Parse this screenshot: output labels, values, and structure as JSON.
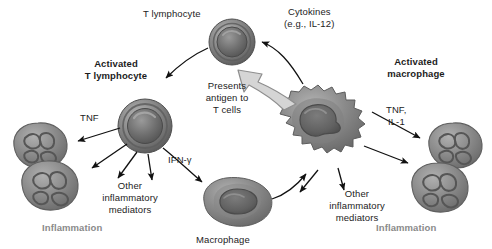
{
  "figure": {
    "background": "#ffffff",
    "text_color": "#1c1c1c",
    "inflammation_color": "#8a8a8a"
  },
  "labels": {
    "t_lymphocyte": "T lymphocyte",
    "activated_t_lymphocyte_line1": "Activated",
    "activated_t_lymphocyte_line2": "T lymphocyte",
    "cytokines_line1": "Cytokines",
    "cytokines_line2": "(e.g., IL-12)",
    "activated_macrophage_line1": "Activated",
    "activated_macrophage_line2": "macrophage",
    "presents_line1": "Presents",
    "presents_line2": "antigen to",
    "presents_line3": "T cells",
    "tnf_left": "TNF",
    "tnf_il1_line1": "TNF,",
    "tnf_il1_line2": "IL-1",
    "ifn_gamma": "IFN-γ",
    "other_mediators_left_line1": "Other",
    "other_mediators_left_line2": "inflammatory",
    "other_mediators_left_line3": "mediators",
    "other_mediators_right_line1": "Other",
    "other_mediators_right_line2": "inflammatory",
    "other_mediators_right_line3": "mediators",
    "inflammation_left": "Inflammation",
    "inflammation_right": "Inflammation",
    "macrophage": "Macrophage"
  },
  "cells": [
    {
      "name": "t-lymphocyte",
      "type": "lymphocyte",
      "cx": 232,
      "cy": 42,
      "r": 24
    },
    {
      "name": "activated-t-lymphocyte",
      "type": "lymphocyte",
      "cx": 145,
      "cy": 125,
      "r": 27
    },
    {
      "name": "activated-macrophage",
      "type": "activated-macrophage",
      "cx": 325,
      "cy": 120,
      "r": 48
    },
    {
      "name": "macrophage",
      "type": "macrophage",
      "cx": 238,
      "cy": 203,
      "r": 34
    },
    {
      "name": "neutrophils-left",
      "type": "neutrophil-pair",
      "cx": 42,
      "cy": 168,
      "r": 42
    },
    {
      "name": "neutrophils-right",
      "type": "neutrophil-pair",
      "cx": 448,
      "cy": 168,
      "r": 42
    }
  ],
  "arrows": [
    {
      "name": "t-lymphocyte-to-activated",
      "from": "t-lymphocyte",
      "to": "activated-t-lymphocyte",
      "style": "curved-black"
    },
    {
      "name": "macrophage-cytokines-to-t-lymphocyte",
      "from": "activated-macrophage",
      "to": "t-lymphocyte",
      "label": "Cytokines (e.g., IL-12)",
      "style": "curved-black"
    },
    {
      "name": "antigen-presentation",
      "from": "activated-macrophage",
      "to": "t-lymphocyte",
      "label": "Presents antigen to T cells",
      "style": "thick-gray-outline"
    },
    {
      "name": "activated-t-to-neutrophils",
      "from": "activated-t-lymphocyte",
      "to": "neutrophils-left",
      "label": "TNF",
      "style": "straight-black"
    },
    {
      "name": "activated-t-to-mediators",
      "from": "activated-t-lymphocyte",
      "to": "other-mediators-left",
      "style": "straight-black"
    },
    {
      "name": "activated-t-to-macrophage",
      "from": "activated-t-lymphocyte",
      "to": "macrophage",
      "label": "IFN-γ",
      "style": "curved-black"
    },
    {
      "name": "macrophage-to-activated-macrophage",
      "from": "macrophage",
      "to": "activated-macrophage",
      "style": "curved-black"
    },
    {
      "name": "activated-macrophage-to-neutrophils",
      "from": "activated-macrophage",
      "to": "neutrophils-right",
      "label": "TNF, IL-1",
      "style": "straight-black"
    },
    {
      "name": "activated-macrophage-to-mediators",
      "from": "activated-macrophage",
      "to": "other-mediators-right",
      "style": "straight-black"
    }
  ]
}
